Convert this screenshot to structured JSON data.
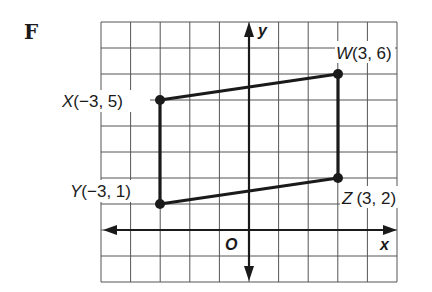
{
  "figure_label": "F",
  "axes": {
    "x_label": "x",
    "y_label": "y",
    "origin_label": "O",
    "x_range": [
      -5,
      5
    ],
    "y_range": [
      -2,
      8
    ]
  },
  "points": [
    {
      "name": "W",
      "coords": "(3, 6)",
      "x": 3,
      "y": 6
    },
    {
      "name": "X",
      "coords": "(−3, 5)",
      "x": -3,
      "y": 5
    },
    {
      "name": "Y",
      "coords": "(−3, 1)",
      "x": -3,
      "y": 1
    },
    {
      "name": "Z",
      "coords": "(3, 2)",
      "x": 3,
      "y": 2
    }
  ],
  "polygon": [
    "X",
    "W",
    "Z",
    "Y"
  ],
  "colors": {
    "ink": "#1a1a1a",
    "grid": "#555555",
    "background": "#ffffff"
  }
}
